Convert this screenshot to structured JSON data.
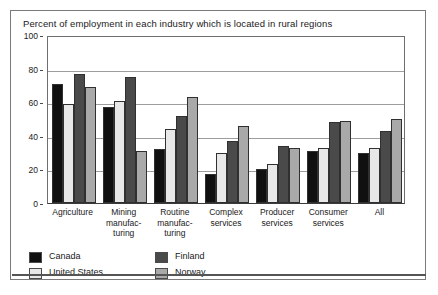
{
  "chart_data": {
    "type": "bar",
    "title": "Percent of employment in each industry which is located in rural regions",
    "xlabel": "",
    "ylabel": "",
    "ylim": [
      0,
      100
    ],
    "yticks": [
      0,
      20,
      40,
      60,
      80,
      100
    ],
    "grid": true,
    "legend_position": "bottom-left",
    "categories": [
      "Agriculture",
      "Mining manufac- turing",
      "Routine manufac- turing",
      "Complex services",
      "Producer services",
      "Consumer services",
      "All"
    ],
    "category_lines": [
      [
        "Agriculture"
      ],
      [
        "Mining",
        "manufac-",
        "turing"
      ],
      [
        "Routine",
        "manufac-",
        "turing"
      ],
      [
        "Complex",
        "services"
      ],
      [
        "Producer",
        "services"
      ],
      [
        "Consumer",
        "services"
      ],
      [
        "All"
      ]
    ],
    "series": [
      {
        "name": "Canada",
        "color": "#101010",
        "values": [
          71,
          57,
          32,
          17,
          20,
          31,
          30
        ]
      },
      {
        "name": "United States",
        "color": "#e8e8e8",
        "values": [
          59,
          61,
          44,
          30,
          23,
          33,
          33
        ]
      },
      {
        "name": "Finland",
        "color": "#4a4a4a",
        "values": [
          77,
          75,
          52,
          37,
          34,
          48,
          43
        ]
      },
      {
        "name": "Norway",
        "color": "#a9a9a9",
        "values": [
          69,
          31,
          63,
          46,
          33,
          49,
          50
        ]
      }
    ]
  },
  "legend": {
    "items": [
      {
        "label": "Canada",
        "color": "#101010"
      },
      {
        "label": "United States",
        "color": "#e8e8e8"
      },
      {
        "label": "Finland",
        "color": "#4a4a4a"
      },
      {
        "label": "Norway",
        "color": "#a9a9a9"
      }
    ]
  }
}
